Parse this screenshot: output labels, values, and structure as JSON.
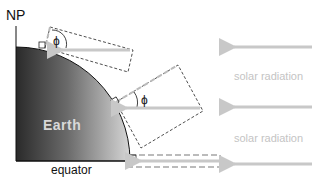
{
  "diagram": {
    "labels": {
      "north_pole": "NP",
      "earth": "Earth",
      "equator": "equator",
      "solar_radiation_1": "solar radiation",
      "solar_radiation_2": "solar radiation",
      "angle_high_latitude": "ϕ",
      "angle_mid_latitude": "ϕ"
    },
    "colors": {
      "earth_dark": "#2a2a2a",
      "earth_light": "#d0d0d0",
      "arrow": "#c8c8c8",
      "dashed_box": "#222222",
      "label_light": "#c4c4c4",
      "label_dark": "#111111"
    },
    "arrows": [
      {
        "name": "radiation-high-latitude",
        "y": 47
      },
      {
        "name": "radiation-mid-latitude",
        "y": 107
      },
      {
        "name": "radiation-equator",
        "y": 161
      }
    ]
  }
}
